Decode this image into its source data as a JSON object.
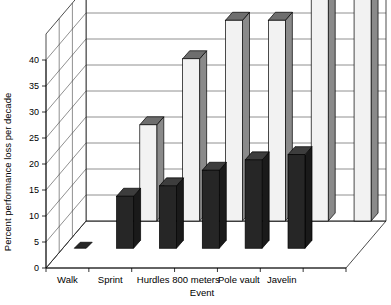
{
  "chart_data": {
    "type": "bar",
    "title": "",
    "subtitle": "",
    "xlabel": "Event",
    "ylabel": "Percent performance loss per decade",
    "categories": [
      "Walk",
      "Sprint",
      "Hurdles",
      "800 meters",
      "Pole vault",
      "Javelin",
      ""
    ],
    "tick_labels_y": [
      "0",
      "5",
      "10",
      "15",
      "20",
      "25",
      "30",
      "35",
      "40"
    ],
    "ylim": [
      0,
      45
    ],
    "ytick_step": 5,
    "grid": true,
    "legend": "none",
    "legend_position": "none",
    "projection": "3d-isometric",
    "series": [
      {
        "name": "back",
        "fill": "#f2f2f2",
        "side_fill": "#8a8a8a",
        "top_fill": "#6e6e6e",
        "values": [
          0,
          18.5,
          31.2,
          38.6,
          38.6,
          43.5,
          44.0
        ]
      },
      {
        "name": "front",
        "fill": "#262626",
        "side_fill": "#1a1a1a",
        "top_fill": "#3d3d3d",
        "values": [
          0.3,
          10.0,
          12.0,
          15.0,
          17.0,
          18.0,
          0
        ]
      }
    ]
  },
  "axes": {
    "y_title": "Percent performance loss per decade",
    "x_title": "Event",
    "y_ticks": [
      "40",
      "35",
      "30",
      "25",
      "20",
      "15",
      "10",
      "5",
      "0"
    ],
    "x_ticks": [
      "Walk",
      "Sprint",
      "Hurdles",
      "800 meters",
      "Pole vault",
      "Javelin"
    ]
  }
}
